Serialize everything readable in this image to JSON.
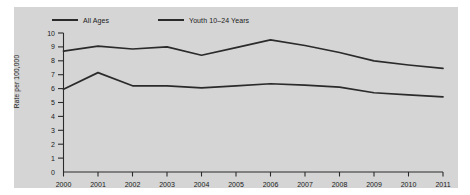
{
  "figure": {
    "panel_color": "#d5d5d5",
    "background_color": "#ffffff",
    "line_color": "#2b2b2b",
    "axis_color": "#2b2b2b"
  },
  "legend": {
    "position": "top-left",
    "items": [
      {
        "label": "All Ages",
        "color": "#2b2b2b"
      },
      {
        "label": "Youth 10–24 Years",
        "color": "#2b2b2b"
      }
    ]
  },
  "axes": {
    "ylabel": "Rate per 100,000",
    "xlabel": "",
    "yticks": [
      "10",
      "9",
      "8",
      "7",
      "6",
      "5",
      "4",
      "3",
      "2",
      "1",
      "0"
    ],
    "xticks": [
      "2000",
      "2001",
      "2002",
      "2003",
      "2004",
      "2005",
      "2006",
      "2007",
      "2008",
      "2009",
      "2010",
      "2011"
    ]
  },
  "chart_data": {
    "type": "line",
    "title": "",
    "xlabel": "",
    "ylabel": "Rate per 100,000",
    "x": [
      2000,
      2001,
      2002,
      2003,
      2004,
      2005,
      2006,
      2007,
      2008,
      2009,
      2010,
      2011
    ],
    "categories": [
      "2000",
      "2001",
      "2002",
      "2003",
      "2004",
      "2005",
      "2006",
      "2007",
      "2008",
      "2009",
      "2010",
      "2011"
    ],
    "series": [
      {
        "name": "All Ages",
        "color": "#2b2b2b",
        "values": [
          5.95,
          7.15,
          6.2,
          6.2,
          6.05,
          6.2,
          6.35,
          6.25,
          6.1,
          5.7,
          5.55,
          5.4
        ]
      },
      {
        "name": "Youth 10–24 Years",
        "color": "#2b2b2b",
        "values": [
          8.7,
          9.05,
          8.85,
          9.0,
          8.4,
          8.95,
          9.5,
          9.1,
          8.6,
          8.0,
          7.7,
          7.45
        ]
      }
    ],
    "ylim": [
      0,
      10
    ],
    "xlim": [
      2000,
      2011
    ],
    "grid": false,
    "legend_position": "top-left"
  }
}
